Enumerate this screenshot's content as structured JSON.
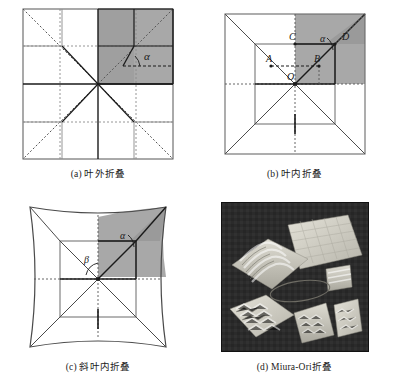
{
  "figure": {
    "layout": "2x2 panel grid",
    "colors": {
      "shade_gray": "#a8a8a8",
      "shade_gray_dark": "#9a9a9a",
      "line_dark": "#1a1a1a",
      "line_light": "#8a8a8a",
      "photo_background": "#2b2b2b",
      "paper_light": "#d8d6cc",
      "page_background": "#ffffff"
    }
  },
  "panels": [
    {
      "id": "panel-a",
      "caption": "(a) 叶外折叠",
      "label": "(a)",
      "name": "叶外折叠",
      "type": "crease-pattern",
      "shape": "square",
      "shaded_quadrant": "top-right",
      "angle_labels": [
        "α"
      ],
      "point_labels": []
    },
    {
      "id": "panel-b",
      "caption": "(b) 叶内折叠",
      "label": "(b)",
      "name": "叶内折叠",
      "type": "crease-pattern",
      "shape": "square",
      "shaded_quadrant": "top-right",
      "angle_labels": [
        "α"
      ],
      "point_labels": [
        "A",
        "B",
        "C",
        "D",
        "O"
      ]
    },
    {
      "id": "panel-c",
      "caption": "(c) 斜叶内折叠",
      "label": "(c)",
      "name": "斜叶内折叠",
      "type": "crease-pattern",
      "shape": "concave-curved-square",
      "shaded_quadrant": "top-right",
      "angle_labels": [
        "α",
        "β"
      ],
      "point_labels": []
    },
    {
      "id": "panel-d",
      "caption": "(d) Miura-Ori折叠",
      "label": "(d)",
      "name": "Miura-Ori折叠",
      "type": "photograph",
      "description": "folded paper specimens on dark background",
      "objects": [
        "flat-grid-sheet",
        "wavy-corrugated-sheet",
        "diamond-corrugated-sheet",
        "small-folded-stack",
        "folded-sample-center",
        "folded-sample-right",
        "thin-ring-wire"
      ]
    }
  ]
}
